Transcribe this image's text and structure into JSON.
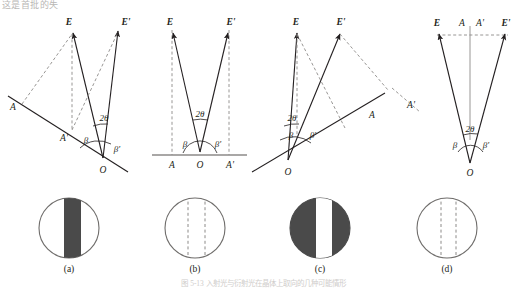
{
  "figure": {
    "top_text_fragment": "这是首批的失",
    "caption": "图 5-13  入射光与衍射光在晶体上取向的几种可能情形",
    "panel_labels": [
      "(a)",
      "(b)",
      "(c)",
      "(d)"
    ],
    "colors": {
      "line": "#231f20",
      "dashed": "#8c8a88",
      "dark_fill": "#4a4a4a",
      "circle_stroke": "#6f6d6b",
      "faint_text": "#c9c7c5"
    },
    "panels": [
      {
        "id": "a",
        "label": "(a)",
        "description": "Crystal surface tilted; incident and diffracted beams asymmetric, surface trace descends left to right",
        "vector_labels": [
          "E",
          "E'"
        ],
        "point_labels": [
          "A",
          "A'",
          "O"
        ],
        "angle_labels": [
          "2θ",
          "β",
          "β'"
        ],
        "circle": {
          "fill": "light",
          "band": "dark-vertical-band",
          "band_position": "right-of-center",
          "dashed_lines": 0
        }
      },
      {
        "id": "b",
        "label": "(b)",
        "description": "Symmetric case; crystal surface horizontal, beams symmetric about vertical normal",
        "vector_labels": [
          "E",
          "E'"
        ],
        "point_labels": [
          "A",
          "O",
          "A'"
        ],
        "angle_labels": [
          "2θ",
          "β",
          "β'"
        ],
        "circle": {
          "fill": "none",
          "band": "none",
          "band_position": "center",
          "dashed_lines": 2
        }
      },
      {
        "id": "c",
        "label": "(c)",
        "description": "Mirror of (a); surface trace ascends left to right, beams asymmetric the other way",
        "vector_labels": [
          "E",
          "E'"
        ],
        "point_labels": [
          "A",
          "O"
        ],
        "angle_labels": [
          "2θ",
          "β",
          "β'"
        ],
        "circle": {
          "fill": "dark",
          "band": "white-vertical-band",
          "band_position": "right-of-center",
          "dashed_lines": 0
        }
      },
      {
        "id": "d",
        "label": "(d)",
        "description": "Narrow beam pair; horizontal dashed screen line at top with projections E, A, A', E'",
        "vector_labels": [
          "E",
          "E'"
        ],
        "point_labels": [
          "A",
          "A'",
          "O"
        ],
        "angle_labels": [
          "2θ",
          "β",
          "β'"
        ],
        "circle": {
          "fill": "none",
          "band": "none",
          "band_position": "center",
          "dashed_lines": 2
        }
      }
    ]
  }
}
